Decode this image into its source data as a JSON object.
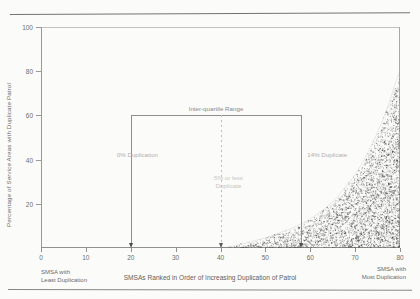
{
  "chart_data": {
    "type": "area",
    "title": "",
    "subtitle": "",
    "xlabel": "SMSAs Ranked in Order of Increasing Duplication of Patrol",
    "ylabel": "Percentage of Service Areas with Duplicate Patrol",
    "xlim": [
      0,
      80
    ],
    "ylim": [
      0,
      100
    ],
    "grid": false,
    "legend_position": "none",
    "x_ticks": [
      "0",
      "10",
      "20",
      "30",
      "40",
      "50",
      "60",
      "70",
      "80"
    ],
    "x_tick_values": [
      0,
      10,
      20,
      30,
      40,
      50,
      60,
      70,
      80
    ],
    "y_ticks": [
      "20",
      "40",
      "60",
      "80",
      "100"
    ],
    "y_tick_values": [
      20,
      40,
      60,
      80,
      100
    ],
    "series": [
      {
        "name": "Percentage of service areas with duplicate patrol",
        "style": "stippled shaded curve",
        "x": [
          0,
          5,
          10,
          15,
          20,
          25,
          30,
          35,
          40,
          42,
          44,
          46,
          48,
          50,
          52,
          54,
          56,
          58,
          60,
          62,
          64,
          66,
          68,
          70,
          72,
          74,
          76,
          78,
          79,
          80
        ],
        "values": [
          0,
          0,
          0,
          0,
          0,
          0,
          0,
          0,
          0,
          0.5,
          1.5,
          2.5,
          3.5,
          4.5,
          6,
          7.5,
          9,
          11,
          13,
          16,
          19,
          23,
          28,
          33,
          40,
          48,
          57,
          68,
          75,
          80
        ]
      }
    ],
    "annotations": [
      {
        "name": "inter-quartile-range",
        "text": "Inter-quartile Range",
        "x": 39,
        "y": 68
      },
      {
        "name": "lower-quartile",
        "text": "0% Duplication",
        "x": 20,
        "y": 42
      },
      {
        "name": "median",
        "text": "5% or less\nDuplicate",
        "x": 40,
        "y": 30
      },
      {
        "name": "upper-quartile",
        "text": "14% Duplicate",
        "x": 58,
        "y": 42
      }
    ],
    "axis_end_notes": {
      "left": "SMSA with\nLeast Duplication",
      "right": "SMSA with\nMost Duplication"
    }
  },
  "chart": {
    "ylabel": "Percentage of Service Areas with Duplicate Patrol",
    "xlabel": "SMSAs Ranked in Order of Increasing Duplication of Patrol",
    "y_ticks": [
      {
        "label": "100",
        "value": 100
      },
      {
        "label": "80",
        "value": 80
      },
      {
        "label": "60",
        "value": 60
      },
      {
        "label": "40",
        "value": 40
      },
      {
        "label": "20",
        "value": 20
      }
    ],
    "x_ticks": [
      {
        "label": "0",
        "value": 0
      },
      {
        "label": "10",
        "value": 10
      },
      {
        "label": "20",
        "value": 20
      },
      {
        "label": "30",
        "value": 30
      },
      {
        "label": "40",
        "value": 40
      },
      {
        "label": "50",
        "value": 50
      },
      {
        "label": "60",
        "value": 60
      },
      {
        "label": "70",
        "value": 70
      },
      {
        "label": "80",
        "value": 80
      }
    ],
    "annotations": {
      "iqr": "Inter-quartile Range",
      "lower_quartile": "0% Duplication",
      "median_line1": "5% or less",
      "median_line2": "Duplicate",
      "upper_quartile": "14% Duplicate"
    },
    "notes": {
      "left_line1": "SMSA with",
      "left_line2": "Least Duplication",
      "right_line1": "SMSA with",
      "right_line2": "Most Duplication"
    },
    "colors": {
      "ink": "#4a4a4a",
      "axis": "#9a9a9a",
      "faint": "#b0b0b0",
      "paper": "#fbfbf9"
    }
  }
}
